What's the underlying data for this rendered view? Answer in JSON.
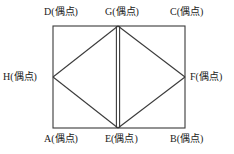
{
  "figure": {
    "type": "graph-diagram",
    "stroke_color": "#3a3a3a",
    "background_color": "#ffffff",
    "label_color": "#1a1a1a",
    "vertices": [
      {
        "id": "D",
        "label": "D(偶点)",
        "position": "top-left",
        "x": 53,
        "y": 26
      },
      {
        "id": "G",
        "label": "G(偶点)",
        "position": "top-middle",
        "x": 118,
        "y": 26
      },
      {
        "id": "C",
        "label": "C(偶点)",
        "position": "top-right",
        "x": 185,
        "y": 26
      },
      {
        "id": "H",
        "label": "H(偶点)",
        "position": "left-middle",
        "x": 53,
        "y": 77
      },
      {
        "id": "F",
        "label": "F(偶点)",
        "position": "right-middle",
        "x": 185,
        "y": 77
      },
      {
        "id": "A",
        "label": "A(偶点)",
        "position": "bottom-left",
        "x": 53,
        "y": 128
      },
      {
        "id": "E",
        "label": "E(偶点)",
        "position": "bottom-middle",
        "x": 118,
        "y": 128
      },
      {
        "id": "B",
        "label": "B(偶点)",
        "position": "bottom-right",
        "x": 185,
        "y": 128
      }
    ],
    "edges": [
      {
        "from": "D",
        "to": "C",
        "kind": "single"
      },
      {
        "from": "C",
        "to": "B",
        "kind": "single"
      },
      {
        "from": "B",
        "to": "A",
        "kind": "single"
      },
      {
        "from": "A",
        "to": "D",
        "kind": "single"
      },
      {
        "from": "H",
        "to": "G",
        "kind": "single"
      },
      {
        "from": "G",
        "to": "F",
        "kind": "single"
      },
      {
        "from": "F",
        "to": "E",
        "kind": "single"
      },
      {
        "from": "E",
        "to": "H",
        "kind": "single"
      },
      {
        "from": "G",
        "to": "E",
        "kind": "double"
      }
    ]
  }
}
